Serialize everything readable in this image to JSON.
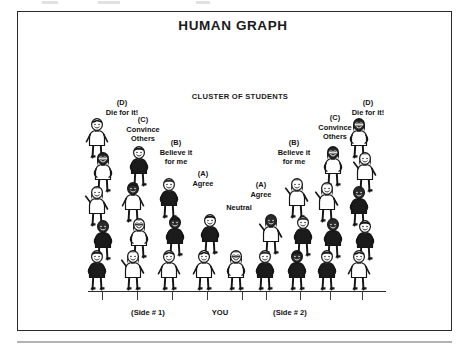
{
  "document": {
    "title": "HUMAN GRAPH",
    "cluster_label": "CLUSTER OF STUDENTS"
  },
  "labels": {
    "left": [
      {
        "name": "die-for-it-left",
        "tag": "(D)",
        "text": "Die for it!",
        "x": 96,
        "y": 98,
        "w": 52
      },
      {
        "name": "convince-others-left",
        "tag": "(C)",
        "text": "Convince\nOthers",
        "x": 118,
        "y": 115,
        "w": 50
      },
      {
        "name": "believe-it-left",
        "tag": "(B)",
        "text": "Believe it\nfor me",
        "x": 150,
        "y": 138,
        "w": 52
      },
      {
        "name": "agree-left",
        "tag": "(A)",
        "text": "Agree",
        "x": 182,
        "y": 169,
        "w": 42
      }
    ],
    "center": [
      {
        "name": "neutral",
        "tag": "",
        "text": "Neutral",
        "x": 218,
        "y": 203,
        "w": 42
      }
    ],
    "right": [
      {
        "name": "agree-right",
        "tag": "(A)",
        "text": "Agree",
        "x": 240,
        "y": 180,
        "w": 42
      },
      {
        "name": "believe-it-right",
        "tag": "(B)",
        "text": "Believe it\nfor me",
        "x": 268,
        "y": 138,
        "w": 52
      },
      {
        "name": "convince-others-right",
        "tag": "(C)",
        "text": "Convince\nOthers",
        "x": 310,
        "y": 113,
        "w": 50
      },
      {
        "name": "die-for-it-right",
        "tag": "(D)",
        "text": "Die for it!",
        "x": 342,
        "y": 98,
        "w": 52
      }
    ]
  },
  "axis": {
    "ticks": [
      102,
      137,
      172,
      207,
      242,
      266,
      300,
      330,
      362
    ],
    "labels": [
      {
        "name": "axis-label-side-1",
        "text": "(Side # 1)",
        "x": 148
      },
      {
        "name": "axis-label-you",
        "text": "YOU",
        "x": 220
      },
      {
        "name": "axis-label-side-2",
        "text": "(Side # 2)",
        "x": 290
      }
    ]
  },
  "chart_data": {
    "type": "bar",
    "title": "HUMAN GRAPH",
    "subtitle": "CLUSTER OF STUDENTS",
    "xlabel": "",
    "ylabel": "Number of students (height of human stack)",
    "categories": [
      "(D) Die for it! — Side #1",
      "(C) Convince Others — Side #1",
      "(B) Believe it for me — Side #1",
      "(A) Agree — Side #1",
      "Neutral — YOU",
      "(A) Agree — Side #2",
      "(B) Believe it for me — Side #2",
      "(C) Convince Others — Side #2",
      "(D) Die for it! — Side #2"
    ],
    "values": [
      5,
      4,
      3,
      2,
      1,
      2,
      3,
      4,
      5
    ],
    "grid": false,
    "legend": "none",
    "note": "Bars are drawn as stacks of cartoon students; bar height equals number of people stacked."
  },
  "figures": {
    "stacks": [
      {
        "name": "stack-d-left",
        "x": 100,
        "base": 291,
        "count": 5,
        "spacing": 34,
        "dark": [
          1,
          3
        ]
      },
      {
        "name": "stack-c-left",
        "x": 136,
        "base": 291,
        "count": 4,
        "spacing": 36,
        "dark": [
          2
        ]
      },
      {
        "name": "stack-b-left",
        "x": 172,
        "base": 291,
        "count": 3,
        "spacing": 38,
        "dark": [
          1
        ]
      },
      {
        "name": "stack-a-left",
        "x": 207,
        "base": 291,
        "count": 2,
        "spacing": 40,
        "dark": []
      },
      {
        "name": "stack-neutral",
        "x": 239,
        "base": 291,
        "count": 1,
        "spacing": 40,
        "dark": []
      },
      {
        "name": "stack-a-right",
        "x": 268,
        "base": 291,
        "count": 2,
        "spacing": 40,
        "dark": [
          1
        ]
      },
      {
        "name": "stack-b-right",
        "x": 300,
        "base": 291,
        "count": 3,
        "spacing": 38,
        "dark": [
          0
        ]
      },
      {
        "name": "stack-c-right",
        "x": 330,
        "base": 291,
        "count": 4,
        "spacing": 36,
        "dark": [
          1,
          3
        ]
      },
      {
        "name": "stack-d-right",
        "x": 362,
        "base": 291,
        "count": 5,
        "spacing": 34,
        "dark": [
          2,
          4
        ]
      }
    ]
  }
}
